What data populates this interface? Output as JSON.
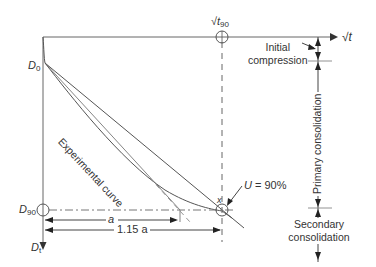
{
  "diagram": {
    "axes": {
      "x_axis_label": "√t",
      "y_axis_label_top": "D",
      "y_axis_label_top_sub": "0",
      "y_axis_label_mid": "D",
      "y_axis_label_mid_sub": "90",
      "y_axis_label_bottom": "D",
      "y_axis_label_bottom_sub": "t"
    },
    "markers": {
      "t90_label": "√t",
      "t90_sub": "90",
      "u_label": "U = 90%",
      "x_label": "x"
    },
    "curve_label": "Experimental curve",
    "dimensions": {
      "a_label": "a",
      "a115_label": "1.15 a"
    },
    "phases": {
      "initial": "Initial compression",
      "initial_line1": "Initial",
      "initial_line2": "compression",
      "primary": "Primary consolidation",
      "secondary_line1": "Secondary",
      "secondary_line2": "consolidation"
    },
    "colors": {
      "line": "#555555",
      "text": "#333333",
      "background": "#ffffff"
    }
  }
}
